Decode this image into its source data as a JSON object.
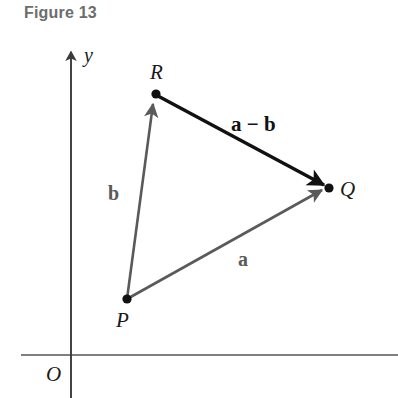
{
  "figure": {
    "caption": "Figure 13",
    "caption_color": "#6d6d6d"
  },
  "axes": {
    "origin_label": "O",
    "y_axis_label": "y",
    "axis_color": "#555555",
    "origin_x": 71,
    "origin_y": 355,
    "y_axis_top": 48,
    "x_axis_right": 398,
    "y_axis_bottom": 398
  },
  "points": [
    {
      "name": "P",
      "label": "P",
      "x": 127,
      "y": 299,
      "label_x": 116,
      "label_y": 326
    },
    {
      "name": "Q",
      "label": "Q",
      "x": 329,
      "y": 188,
      "label_x": 340,
      "label_y": 196
    },
    {
      "name": "R",
      "label": "R",
      "x": 156,
      "y": 94,
      "label_x": 150,
      "label_y": 78
    }
  ],
  "vectors": [
    {
      "name": "a",
      "label": "a",
      "from": "P",
      "to": "Q",
      "color": "#5a5a5a",
      "width": 2.6,
      "label_x": 243,
      "label_y": 266
    },
    {
      "name": "b",
      "label": "b",
      "from": "P",
      "to": "R",
      "color": "#5a5a5a",
      "width": 2.6,
      "label_x": 113,
      "label_y": 199
    },
    {
      "name": "a-minus-b",
      "label": "a − b",
      "from": "R",
      "to": "Q",
      "color": "#111111",
      "width": 3.4,
      "label_x": 234,
      "label_y": 130
    }
  ]
}
